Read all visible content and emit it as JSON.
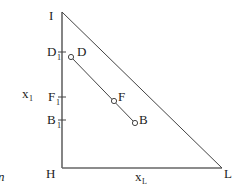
{
  "diagram": {
    "vertices": {
      "I": {
        "label": "I"
      },
      "H": {
        "label": "H"
      },
      "L": {
        "label": "L"
      }
    },
    "axis_ticks": {
      "D1": {
        "main": "D",
        "sub": "1"
      },
      "F1": {
        "main": "F",
        "sub": "1"
      },
      "B1": {
        "main": "B",
        "sub": "1"
      }
    },
    "points": {
      "D": {
        "label": "D"
      },
      "F": {
        "label": "F"
      },
      "B": {
        "label": "B"
      }
    },
    "axis_labels": {
      "x1": {
        "main": "x",
        "sub": "1"
      },
      "xL": {
        "main": "x",
        "sub": "L"
      }
    },
    "margin_text": "n",
    "colors": {
      "line": "#555555",
      "text": "#222222"
    }
  }
}
